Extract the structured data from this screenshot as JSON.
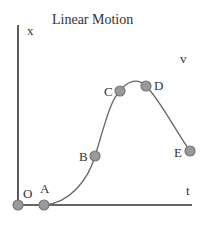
{
  "title": "Linear Motion",
  "axes": {
    "y_label": "x",
    "x_label": "t",
    "extra_label": "v"
  },
  "points": [
    {
      "label": "O",
      "x": 18,
      "y": 205
    },
    {
      "label": "A",
      "x": 44,
      "y": 205
    },
    {
      "label": "B",
      "x": 95,
      "y": 156
    },
    {
      "label": "C",
      "x": 120,
      "y": 91
    },
    {
      "label": "D",
      "x": 146,
      "y": 86
    },
    {
      "label": "E",
      "x": 190,
      "y": 151
    }
  ],
  "colors": {
    "axis": "#333333",
    "curve": "#666666",
    "point_fill": "#9a9a9a",
    "point_stroke": "#777777"
  }
}
